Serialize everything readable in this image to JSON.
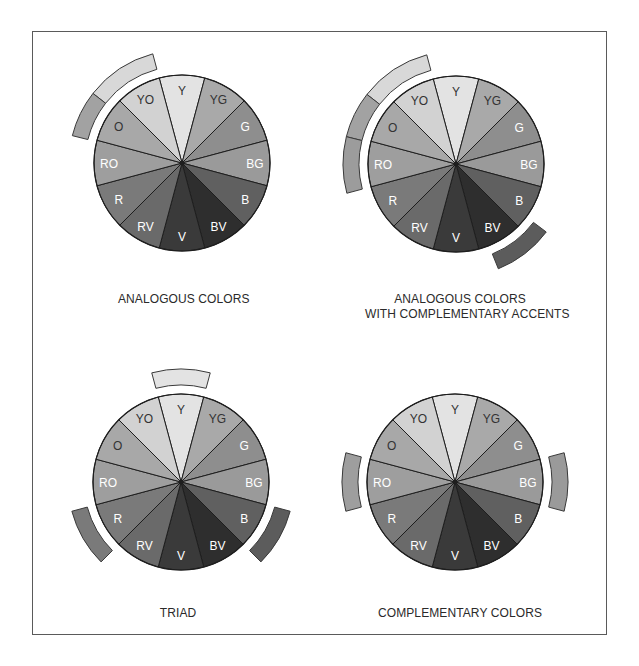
{
  "segments": [
    {
      "label": "Y",
      "color": "#e3e3e3",
      "text_color": "#333333"
    },
    {
      "label": "YG",
      "color": "#a9a9a9",
      "text_color": "#333333"
    },
    {
      "label": "G",
      "color": "#8e8e8e",
      "text_color": "#ffffff"
    },
    {
      "label": "BG",
      "color": "#9a9a9a",
      "text_color": "#ffffff"
    },
    {
      "label": "B",
      "color": "#606060",
      "text_color": "#ffffff"
    },
    {
      "label": "BV",
      "color": "#2e2e2e",
      "text_color": "#ffffff"
    },
    {
      "label": "V",
      "color": "#3a3a3a",
      "text_color": "#ffffff"
    },
    {
      "label": "RV",
      "color": "#6a6a6a",
      "text_color": "#ffffff"
    },
    {
      "label": "R",
      "color": "#7a7a7a",
      "text_color": "#ffffff"
    },
    {
      "label": "RO",
      "color": "#9e9e9e",
      "text_color": "#ffffff"
    },
    {
      "label": "O",
      "color": "#a8a8a8",
      "text_color": "#333333"
    },
    {
      "label": "YO",
      "color": "#d2d2d2",
      "text_color": "#333333"
    }
  ],
  "wheels": [
    {
      "id": "analogous",
      "caption_lines": [
        "ANALOGOUS COLORS"
      ],
      "center": [
        182,
        163
      ],
      "accents": [
        {
          "from_deg": -52,
          "to_deg": -15,
          "color": "#d8d8d8"
        },
        {
          "from_deg": -76,
          "to_deg": -52,
          "color": "#a2a2a2"
        }
      ]
    },
    {
      "id": "analogous-complementary",
      "caption_lines": [
        "ANALOGOUS COLORS",
        "WITH COMPLEMENTARY ACCENTS"
      ],
      "center": [
        456,
        164
      ],
      "accents": [
        {
          "from_deg": -52,
          "to_deg": -15,
          "color": "#d8d8d8"
        },
        {
          "from_deg": -76,
          "to_deg": -52,
          "color": "#a2a2a2"
        },
        {
          "from_deg": -105,
          "to_deg": -76,
          "color": "#9c9c9c"
        },
        {
          "from_deg": 127,
          "to_deg": 158,
          "color": "#5c5c5c"
        }
      ]
    },
    {
      "id": "triad",
      "caption_lines": [
        "TRIAD"
      ],
      "center": [
        181,
        482
      ],
      "accents": [
        {
          "from_deg": -15,
          "to_deg": 15,
          "color": "#e3e3e3"
        },
        {
          "from_deg": -135,
          "to_deg": -105,
          "color": "#7a7a7a"
        },
        {
          "from_deg": 105,
          "to_deg": 135,
          "color": "#5c5c5c"
        }
      ]
    },
    {
      "id": "complementary",
      "caption_lines": [
        "COMPLEMENTARY COLORS"
      ],
      "center": [
        455,
        482
      ],
      "accents": [
        {
          "from_deg": -105,
          "to_deg": -75,
          "color": "#9e9e9e"
        },
        {
          "from_deg": 75,
          "to_deg": 105,
          "color": "#9a9a9a"
        }
      ]
    }
  ],
  "geometry": {
    "radius": 88,
    "accent_inner": 97,
    "accent_outer": 113,
    "label_radius": 73
  },
  "captions": {
    "analogous": "ANALOGOUS COLORS",
    "analogous_comp_1": "ANALOGOUS COLORS",
    "analogous_comp_2": "WITH COMPLEMENTARY ACCENTS",
    "triad": "TRIAD",
    "complementary": "COMPLEMENTARY COLORS"
  }
}
